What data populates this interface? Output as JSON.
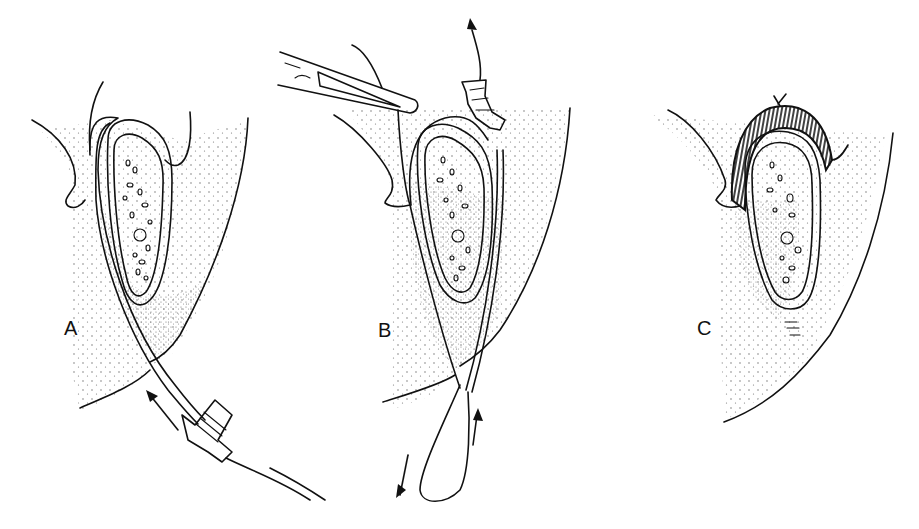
{
  "figure": {
    "panels": [
      {
        "id": "A",
        "label": "A",
        "description": "Catheter passed around bone with syringe hub below, arrow indicating insertion direction"
      },
      {
        "id": "B",
        "label": "B",
        "description": "Forceps grasping catheter tip above; syringe hub at top with arrow; looped wire below with bidirectional arrows"
      },
      {
        "id": "C",
        "label": "C",
        "description": "Hatched cerclage band wrapped over top of bone, tied with knot"
      }
    ],
    "colors": {
      "ink": "#111111",
      "background": "#ffffff",
      "stipple": "#555555"
    }
  }
}
